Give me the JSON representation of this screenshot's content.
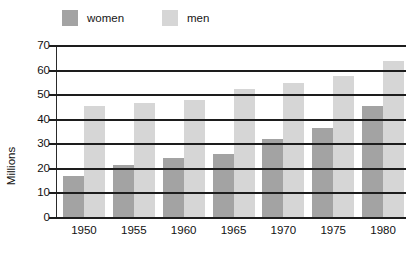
{
  "chart_data": {
    "type": "bar",
    "title": "",
    "xlabel": "",
    "ylabel": "Millions",
    "categories": [
      "1950",
      "1955",
      "1960",
      "1965",
      "1970",
      "1975",
      "1980"
    ],
    "series": [
      {
        "name": "women",
        "color": "#a3a3a3",
        "values": [
          17,
          21.5,
          24.5,
          26,
          32,
          36.5,
          45.5
        ]
      },
      {
        "name": "men",
        "color": "#d6d6d6",
        "values": [
          45.5,
          47,
          48,
          52.5,
          55,
          58,
          64
        ]
      }
    ],
    "ylim": [
      0,
      70
    ],
    "yticks": [
      "0",
      "10",
      "20",
      "30",
      "40",
      "50",
      "60",
      "70"
    ],
    "grid": true,
    "legend_position": "top-left"
  },
  "legend": {
    "entries": [
      {
        "label": "women",
        "color": "#a3a3a3"
      },
      {
        "label": "men",
        "color": "#d6d6d6"
      }
    ]
  },
  "axes": {
    "y_title": "Millions"
  }
}
